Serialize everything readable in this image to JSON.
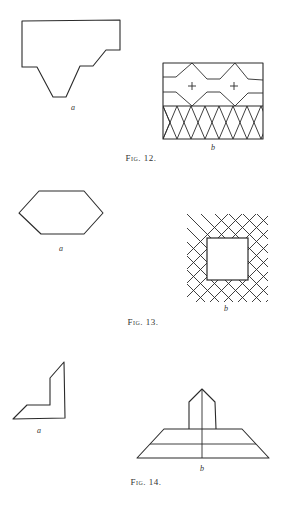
{
  "figures": [
    {
      "id": "fig12",
      "caption": "Fig. 12.",
      "panels": [
        {
          "label": "a",
          "description": "Stepped polygon outline with trapezoidal notch at bottom"
        },
        {
          "label": "b",
          "description": "Rectangle with zig-zag band, two plus signs, and lattice of diamonds"
        }
      ]
    },
    {
      "id": "fig13",
      "caption": "Fig. 13.",
      "panels": [
        {
          "label": "a",
          "description": "Elongated hexagon outline"
        },
        {
          "label": "b",
          "description": "Square framed by diagonal lattice grid"
        }
      ]
    },
    {
      "id": "fig14",
      "caption": "Fig. 14.",
      "panels": [
        {
          "label": "a",
          "description": "L-shaped angled outline"
        },
        {
          "label": "b",
          "description": "Pointed house shape atop stacked trapezoid with vertical axis"
        }
      ]
    }
  ],
  "colors": {
    "ink": "#2a2a2a",
    "paper": "#ffffff"
  }
}
